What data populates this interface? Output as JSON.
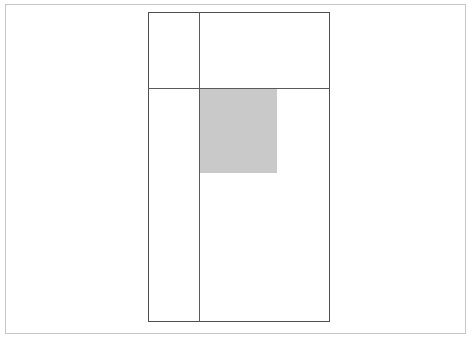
{
  "figure": {
    "title": "",
    "background_color": "#ffffff",
    "outer_frame": {
      "name": "outer-frame",
      "stroke_color": "#c6c6c6",
      "stroke_width": 1,
      "x": 5,
      "y": 4,
      "width": 461,
      "height": 330,
      "label": ""
    },
    "main_rectangle": {
      "name": "figure-rectangle",
      "stroke_color": "#4e4e4e",
      "stroke_width": 1,
      "x": 148,
      "y": 12,
      "width": 182,
      "height": 310,
      "label": ""
    },
    "lines": [
      {
        "name": "divider-horizontal",
        "orientation": "horizontal",
        "x1": 148,
        "y1": 88,
        "x2": 330,
        "y2": 88,
        "stroke_color": "#5a5a5a",
        "stroke_width": 1,
        "label": ""
      },
      {
        "name": "divider-vertical",
        "orientation": "vertical",
        "x1": 199,
        "y1": 12,
        "x2": 199,
        "y2": 322,
        "stroke_color": "#5a5a5a",
        "stroke_width": 1,
        "label": ""
      }
    ],
    "shaded_region": {
      "name": "shaded-square",
      "fill_color": "#c9c9c9",
      "x": 200,
      "y": 89,
      "width": 77,
      "height": 84,
      "label": ""
    }
  },
  "annotations": {
    "caption": "",
    "notes": ""
  }
}
